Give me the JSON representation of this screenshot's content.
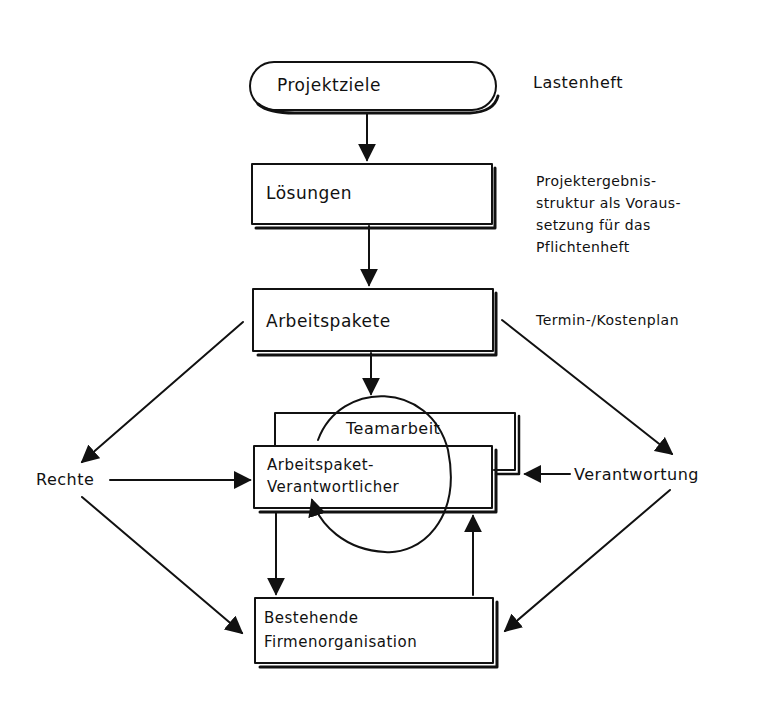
{
  "diagram": {
    "type": "hand-drawn flowchart",
    "stroke_color": "#111111",
    "background": "#ffffff",
    "nodes": {
      "projektziele": {
        "label": "Projektziele",
        "shape": "rounded"
      },
      "loesungen": {
        "label": "Lösungen",
        "shape": "box"
      },
      "arbeitspakete": {
        "label": "Arbeitspakete",
        "shape": "box"
      },
      "teamarbeit": {
        "label": "Teamarbeit",
        "shape": "box-behind"
      },
      "verantwortlicher": {
        "line1": "Arbeitspaket-",
        "line2": "Verantwortlicher",
        "shape": "box"
      },
      "firmenorganisation": {
        "line1": "Bestehende",
        "line2": "Firmenorganisation",
        "shape": "box"
      },
      "rechte": {
        "label": "Rechte",
        "shape": "text"
      },
      "verantwortung": {
        "label": "Verantwortung",
        "shape": "text"
      }
    },
    "annotations": {
      "lastenheft": "Lastenheft",
      "pflichtenheft_lines": [
        "Projektergebnis-",
        "struktur als Voraus-",
        "setzung für das",
        "Pflichtenheft"
      ],
      "terminplan": "Termin-/Kostenplan"
    },
    "edges": [
      {
        "from": "Projektziele",
        "to": "Lösungen"
      },
      {
        "from": "Lösungen",
        "to": "Arbeitspakete"
      },
      {
        "from": "Arbeitspakete",
        "to": "Teamarbeit / Arbeitspaket-Verantwortlicher"
      },
      {
        "from": "Arbeitspakete",
        "to": "Rechte"
      },
      {
        "from": "Arbeitspakete",
        "to": "Verantwortung"
      },
      {
        "from": "Rechte",
        "to": "Arbeitspaket-Verantwortlicher"
      },
      {
        "from": "Rechte",
        "to": "Bestehende Firmenorganisation"
      },
      {
        "from": "Verantwortung",
        "to": "Teamarbeit"
      },
      {
        "from": "Verantwortung",
        "to": "Bestehende Firmenorganisation"
      },
      {
        "from": "Arbeitspaket-Verantwortlicher",
        "to": "Bestehende Firmenorganisation"
      },
      {
        "from": "Bestehende Firmenorganisation",
        "to": "Arbeitspaket-Verantwortlicher"
      },
      {
        "from": "Teamarbeit circle",
        "to": "Arbeitspaket-Verantwortlicher",
        "style": "circular loop"
      }
    ]
  }
}
